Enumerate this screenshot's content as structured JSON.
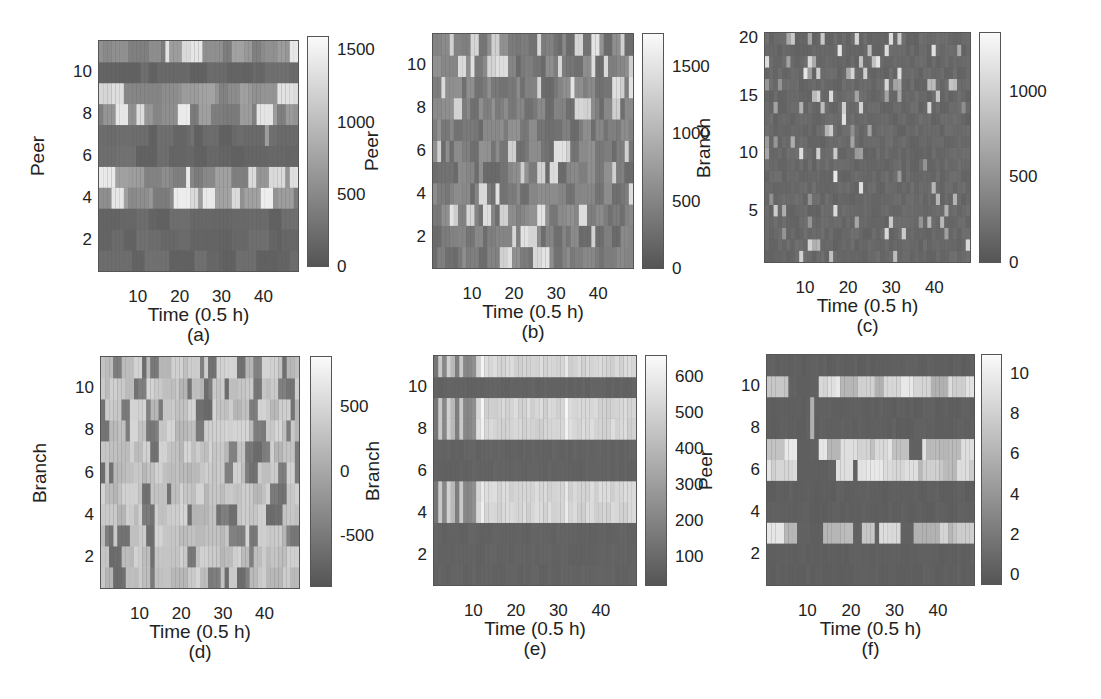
{
  "figure": {
    "panels": [
      {
        "id": "a",
        "caption": "(a)",
        "xlabel": "Time (0.5 h)",
        "ylabel": "Peer",
        "plot": {
          "x": 98,
          "y": 40,
          "w": 201,
          "h": 232
        },
        "cbar": {
          "x": 307,
          "y": 36,
          "w": 22,
          "h": 231
        },
        "yticks": [
          "10",
          "8",
          "6",
          "4",
          "2"
        ],
        "ytick_vals": [
          10,
          8,
          6,
          4,
          2
        ],
        "ymin": 1,
        "ymax": 11,
        "xticks": [
          "10",
          "20",
          "30",
          "40"
        ],
        "cticks": [
          "1500",
          "1000",
          "500",
          "0"
        ],
        "ctick_vals": [
          1500,
          1000,
          500,
          0
        ],
        "cmin": 0,
        "cmax": 1600
      },
      {
        "id": "b",
        "caption": "(b)",
        "xlabel": "Time (0.5 h)",
        "ylabel": "Peer",
        "plot": {
          "x": 432,
          "y": 33,
          "w": 202,
          "h": 236
        },
        "cbar": {
          "x": 642,
          "y": 33,
          "w": 22,
          "h": 236
        },
        "yticks": [
          "10",
          "8",
          "6",
          "4",
          "2"
        ],
        "ytick_vals": [
          10,
          8,
          6,
          4,
          2
        ],
        "ymin": 1,
        "ymax": 11,
        "xticks": [
          "10",
          "20",
          "30",
          "40"
        ],
        "cticks": [
          "1500",
          "1000",
          "500",
          "0"
        ],
        "ctick_vals": [
          1500,
          1000,
          500,
          0
        ],
        "cmin": 0,
        "cmax": 1750
      },
      {
        "id": "c",
        "caption": "(c)",
        "xlabel": "Time (0.5 h)",
        "ylabel": "Branch",
        "plot": {
          "x": 764,
          "y": 32,
          "w": 207,
          "h": 231
        },
        "cbar": {
          "x": 979,
          "y": 32,
          "w": 22,
          "h": 231
        },
        "yticks": [
          "20",
          "15",
          "10",
          "5"
        ],
        "ytick_vals": [
          20,
          15,
          10,
          5
        ],
        "ymin": 1,
        "ymax": 20,
        "xticks": [
          "10",
          "20",
          "30",
          "40"
        ],
        "cticks": [
          "1000",
          "500",
          "0"
        ],
        "ctick_vals": [
          1000,
          500,
          0
        ],
        "cmin": 0,
        "cmax": 1350
      },
      {
        "id": "d",
        "caption": "(d)",
        "xlabel": "Time (0.5 h)",
        "ylabel": "Branch",
        "plot": {
          "x": 100,
          "y": 356,
          "w": 200,
          "h": 233
        },
        "cbar": {
          "x": 310,
          "y": 356,
          "w": 22,
          "h": 231
        },
        "yticks": [
          "10",
          "8",
          "6",
          "4",
          "2"
        ],
        "ytick_vals": [
          10,
          8,
          6,
          4,
          2
        ],
        "ymin": 1,
        "ymax": 11,
        "xticks": [
          "10",
          "20",
          "30",
          "40"
        ],
        "cticks": [
          "500",
          "0",
          "-500"
        ],
        "ctick_vals": [
          500,
          0,
          -500
        ],
        "cmin": -900,
        "cmax": 900
      },
      {
        "id": "e",
        "caption": "(e)",
        "xlabel": "Time (0.5 h)",
        "ylabel": "Branch",
        "plot": {
          "x": 433,
          "y": 355,
          "w": 204,
          "h": 231
        },
        "cbar": {
          "x": 645,
          "y": 355,
          "w": 22,
          "h": 231
        },
        "yticks": [
          "10",
          "8",
          "6",
          "4",
          "2"
        ],
        "ytick_vals": [
          10,
          8,
          6,
          4,
          2
        ],
        "ymin": 1,
        "ymax": 11,
        "xticks": [
          "10",
          "20",
          "30",
          "40"
        ],
        "cticks": [
          "600",
          "500",
          "400",
          "300",
          "200",
          "100"
        ],
        "ctick_vals": [
          600,
          500,
          400,
          300,
          200,
          100
        ],
        "cmin": 20,
        "cmax": 660
      },
      {
        "id": "f",
        "caption": "(f)",
        "xlabel": "Time (0.5 h)",
        "ylabel": "Peer",
        "plot": {
          "x": 766,
          "y": 354,
          "w": 209,
          "h": 232
        },
        "cbar": {
          "x": 981,
          "y": 354,
          "w": 21,
          "h": 231
        },
        "yticks": [
          "10",
          "8",
          "6",
          "4",
          "2"
        ],
        "ytick_vals": [
          10,
          8,
          6,
          4,
          2
        ],
        "ymin": 1,
        "ymax": 11,
        "xticks": [
          "10",
          "20",
          "30",
          "40"
        ],
        "cticks": [
          "10",
          "8",
          "6",
          "4",
          "2",
          "0"
        ],
        "ctick_vals": [
          10,
          8,
          6,
          4,
          2,
          0
        ],
        "cmin": -0.5,
        "cmax": 11
      }
    ]
  },
  "chart_data": [
    {
      "type": "heatmap",
      "panel": "(a)",
      "xlabel": "Time (0.5 h)",
      "ylabel": "Peer",
      "x_range": [
        1,
        48
      ],
      "y_range": [
        1,
        11
      ],
      "xticks": [
        10,
        20,
        30,
        40
      ],
      "yticks": [
        2,
        4,
        6,
        8,
        10
      ],
      "colorbar": {
        "range": [
          0,
          1600
        ],
        "ticks": [
          0,
          500,
          1000,
          1500
        ]
      },
      "colormap": "gray",
      "description": "Peer rows 11, 9, 8, 5, 4 show higher values (up to ~1500); rows 10, 7, 6, 3 are low (~100-300)"
    },
    {
      "type": "heatmap",
      "panel": "(b)",
      "xlabel": "Time (0.5 h)",
      "ylabel": "Peer",
      "x_range": [
        1,
        48
      ],
      "y_range": [
        1,
        11
      ],
      "xticks": [
        10,
        20,
        30,
        40
      ],
      "yticks": [
        2,
        4,
        6,
        8,
        10
      ],
      "colorbar": {
        "range": [
          0,
          1750
        ],
        "ticks": [
          0,
          500,
          1000,
          1500
        ]
      },
      "colormap": "gray",
      "description": "Scattered values across all peers; mostly 200-700 with sparse bright cells up to ~1600"
    },
    {
      "type": "heatmap",
      "panel": "(c)",
      "xlabel": "Time (0.5 h)",
      "ylabel": "Branch",
      "x_range": [
        1,
        48
      ],
      "y_range": [
        1,
        20
      ],
      "xticks": [
        10,
        20,
        30,
        40
      ],
      "yticks": [
        5,
        10,
        15,
        20
      ],
      "colorbar": {
        "range": [
          0,
          1350
        ],
        "ticks": [
          0,
          500,
          1000
        ]
      },
      "colormap": "gray",
      "description": "Mostly low values (~100-200) with sparse bright cells (500-1200), denser in upper branches"
    },
    {
      "type": "heatmap",
      "panel": "(d)",
      "xlabel": "Time (0.5 h)",
      "ylabel": "Branch",
      "x_range": [
        1,
        48
      ],
      "y_range": [
        1,
        11
      ],
      "xticks": [
        10,
        20,
        30,
        40
      ],
      "yticks": [
        2,
        4,
        6,
        8,
        10
      ],
      "colorbar": {
        "range": [
          -900,
          900
        ],
        "ticks": [
          -500,
          0,
          500
        ]
      },
      "colormap": "gray",
      "description": "Mostly positive values (~200-700) with scattered negative cells (down to ~-800)"
    },
    {
      "type": "heatmap",
      "panel": "(e)",
      "xlabel": "Time (0.5 h)",
      "ylabel": "Branch",
      "x_range": [
        1,
        48
      ],
      "y_range": [
        1,
        11
      ],
      "xticks": [
        10,
        20,
        30,
        40
      ],
      "yticks": [
        2,
        4,
        6,
        8,
        10
      ],
      "colorbar": {
        "range": [
          20,
          660
        ],
        "ticks": [
          100,
          200,
          300,
          400,
          500,
          600
        ]
      },
      "colormap": "gray",
      "description": "Branches 10, 7, 6, 3, 2, 1 low (~80); branches 11, 9, 8, 5, 4 high (~480-620) after t=10, with mixed values before t=10"
    },
    {
      "type": "heatmap",
      "panel": "(f)",
      "xlabel": "Time (0.5 h)",
      "ylabel": "Peer",
      "x_range": [
        1,
        48
      ],
      "y_range": [
        1,
        11
      ],
      "xticks": [
        10,
        20,
        30,
        40
      ],
      "yticks": [
        2,
        4,
        6,
        8,
        10
      ],
      "colorbar": {
        "range": [
          -0.5,
          11
        ],
        "ticks": [
          0,
          2,
          4,
          6,
          8,
          10
        ]
      },
      "colormap": "gray",
      "description": "Peers 10, 7, 6, 3 show high values (~6-10); peers 11, 9, 8, 5, 4, 2, 1 near 0"
    }
  ]
}
